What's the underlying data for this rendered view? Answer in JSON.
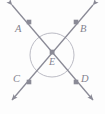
{
  "figure": {
    "type": "geometry-diagram",
    "width": 105,
    "height": 114,
    "background_color": "#fdfdfd",
    "stroke_color": "#8a8a96",
    "label_color": "#83838f",
    "labels": {
      "a": "A",
      "b": "B",
      "c": "C",
      "d": "D",
      "e": "E"
    },
    "points": [
      {
        "name": "A",
        "label": "A",
        "x": 29,
        "y": 22,
        "marker": "square"
      },
      {
        "name": "B",
        "label": "B",
        "x": 76,
        "y": 22,
        "marker": "square"
      },
      {
        "name": "C",
        "label": "C",
        "x": 29,
        "y": 82,
        "marker": "square"
      },
      {
        "name": "D",
        "label": "D",
        "x": 76,
        "y": 82,
        "marker": "square"
      },
      {
        "name": "E",
        "label": "E",
        "x": 52,
        "y": 52,
        "marker": "square"
      }
    ],
    "lines": [
      {
        "name": "line-AD",
        "from": {
          "x": 12,
          "y": 5
        },
        "to": {
          "x": 93,
          "y": 100
        },
        "arrows": "both",
        "through": [
          "A",
          "E",
          "D"
        ]
      },
      {
        "name": "line-BC",
        "from": {
          "x": 93,
          "y": 5
        },
        "to": {
          "x": 12,
          "y": 100
        },
        "arrows": "both",
        "through": [
          "B",
          "E",
          "C"
        ]
      }
    ],
    "circle": {
      "name": "angle-circle",
      "cx": 52,
      "cy": 55,
      "r": 22,
      "stroke": "#b0b0ba",
      "fill": "none"
    }
  }
}
